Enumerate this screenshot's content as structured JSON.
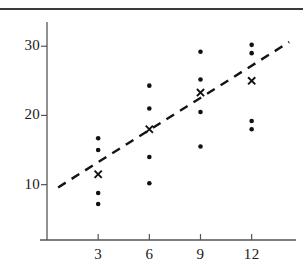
{
  "figure": {
    "title": "",
    "background_color": "#ffffff",
    "top_rule_color": "#3a3a3a"
  },
  "axes": {
    "x_tick_labels": [
      "3",
      "6",
      "9",
      "12"
    ],
    "y_tick_labels": [
      "10",
      "20",
      "30"
    ],
    "axis_color": "#555555",
    "xlabel": "",
    "ylabel": ""
  },
  "legend": {
    "dot_series_name": "observation",
    "cross_series_name": "group-mean",
    "line_series_name": "trend-line"
  },
  "chart_data": {
    "type": "scatter",
    "title": "",
    "xlabel": "",
    "ylabel": "",
    "xlim": [
      0,
      14.6
    ],
    "ylim": [
      2.0,
      33.5
    ],
    "grid": false,
    "legend_position": "none",
    "x_ticks": [
      3,
      6,
      9,
      12
    ],
    "y_ticks": [
      10,
      20,
      30
    ],
    "series": [
      {
        "name": "observation",
        "marker": "dot",
        "color": "#111111",
        "points": [
          {
            "x": 3,
            "y": 16.7
          },
          {
            "x": 3,
            "y": 15.0
          },
          {
            "x": 3,
            "y": 8.8
          },
          {
            "x": 3,
            "y": 7.2
          },
          {
            "x": 6,
            "y": 24.3
          },
          {
            "x": 6,
            "y": 21.0
          },
          {
            "x": 6,
            "y": 14.0
          },
          {
            "x": 6,
            "y": 10.2
          },
          {
            "x": 9,
            "y": 29.2
          },
          {
            "x": 9,
            "y": 25.2
          },
          {
            "x": 9,
            "y": 20.5
          },
          {
            "x": 9,
            "y": 15.5
          },
          {
            "x": 12,
            "y": 30.2
          },
          {
            "x": 12,
            "y": 29.0
          },
          {
            "x": 12,
            "y": 19.2
          },
          {
            "x": 12,
            "y": 18.0
          }
        ]
      },
      {
        "name": "group-mean",
        "marker": "cross",
        "color": "#111111",
        "points": [
          {
            "x": 3,
            "y": 11.5
          },
          {
            "x": 6,
            "y": 18.0
          },
          {
            "x": 9,
            "y": 23.3
          },
          {
            "x": 12,
            "y": 25.0
          }
        ]
      },
      {
        "name": "trend-line",
        "marker": "dashed-line",
        "color": "#141414",
        "points": [
          {
            "x": 0.65,
            "y": 9.6
          },
          {
            "x": 14.2,
            "y": 30.6
          }
        ]
      }
    ]
  }
}
